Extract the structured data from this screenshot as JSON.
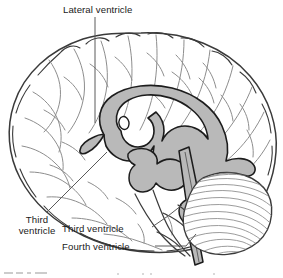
{
  "figure": {
    "title": "Lateral ventricle",
    "caption": ""
  },
  "labels": {
    "lateral_ventricle": "Lateral ventricle",
    "third_ventricle_left_line1": "Third",
    "third_ventricle_left_line2": "ventricle",
    "third_ventricle_mid": "Third ventricle",
    "fourth_ventricle": "Fourth ventricle"
  },
  "colors": {
    "ventricle_fill": "#b9b9b9",
    "ventricle_stroke": "#1c1c1c",
    "brain_outline": "#3a3a3a",
    "sulci": "#8d8d8d",
    "cerebellum_hatch": "#8a8a8a",
    "leader_line": "#5a5a5a",
    "text": "#1a1a1a",
    "background": "#ffffff"
  },
  "structures": [
    {
      "name": "cerebrum",
      "style": "outline-with-sulci"
    },
    {
      "name": "lateral-ventricle",
      "style": "gray-filled-c-shape"
    },
    {
      "name": "interventricular-foramen",
      "style": "small-white-oval"
    },
    {
      "name": "third-ventricle",
      "style": "gray-central-cavity"
    },
    {
      "name": "cerebral-aqueduct",
      "style": "narrow-gray-channel"
    },
    {
      "name": "fourth-ventricle",
      "style": "gray-tapering-channel"
    },
    {
      "name": "cerebellum",
      "style": "hatched-folia"
    },
    {
      "name": "brainstem",
      "style": "outline"
    }
  ]
}
